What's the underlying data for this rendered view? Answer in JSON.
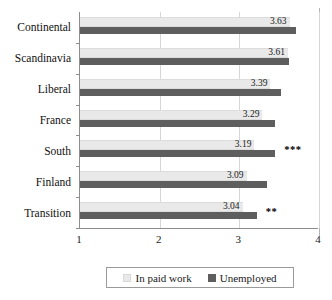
{
  "chart_data": {
    "type": "bar",
    "orientation": "horizontal",
    "title": "",
    "xlabel": "",
    "ylabel": "",
    "xlim": [
      1,
      4
    ],
    "xticks": [
      "1",
      "2",
      "3",
      "4"
    ],
    "grid": true,
    "legend_position": "bottom",
    "categories": [
      "Continental",
      "Scandinavia",
      "Liberal",
      "France",
      "South",
      "Finland",
      "Transition"
    ],
    "series": [
      {
        "name": "In paid work",
        "color": "#e9e9e9",
        "values": [
          3.63,
          3.61,
          3.39,
          3.29,
          3.19,
          3.09,
          3.04
        ],
        "labels": [
          "3.63",
          "3.61",
          "3.39",
          "3.29",
          "3.19",
          "3.09",
          "3.04"
        ]
      },
      {
        "name": "Unemployed",
        "color": "#5e5e5e",
        "values": [
          3.71,
          3.62,
          3.52,
          3.45,
          3.45,
          3.35,
          3.22
        ],
        "labels": [
          "",
          "",
          "",
          "",
          "",
          "",
          ""
        ]
      }
    ],
    "annotations": [
      "",
      "",
      "",
      "",
      "***",
      "",
      "**"
    ]
  },
  "legend": {
    "items": [
      {
        "label": "In paid work",
        "color": "#e9e9e9"
      },
      {
        "label": "Unemployed",
        "color": "#5e5e5e"
      }
    ]
  },
  "axis": {
    "x_tick_labels": [
      "1",
      "2",
      "3",
      "4"
    ],
    "x_min": 1,
    "x_max": 4
  }
}
